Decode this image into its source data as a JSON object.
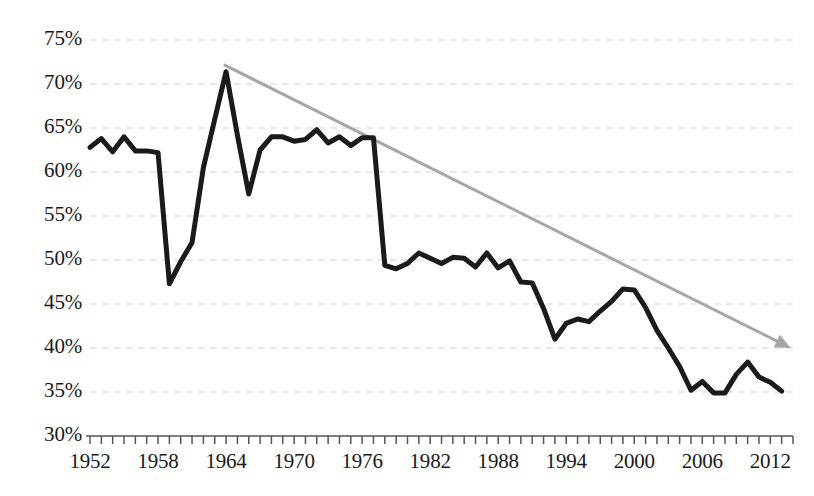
{
  "chart_data": {
    "type": "line",
    "title": "",
    "subtitle": "",
    "xlabel": "",
    "ylabel": "",
    "xlim": [
      1952,
      2014
    ],
    "ylim": [
      30,
      75
    ],
    "ytick_format": "percent",
    "grid": true,
    "grid_axis": "y",
    "grid_style": "dashed",
    "legend": "none",
    "yticks": [
      30,
      35,
      40,
      45,
      50,
      55,
      60,
      65,
      70,
      75
    ],
    "ytick_labels": [
      "30%",
      "35%",
      "40%",
      "45%",
      "50%",
      "55%",
      "60%",
      "65%",
      "70%",
      "75%"
    ],
    "xticks": [
      1952,
      1958,
      1964,
      1970,
      1976,
      1982,
      1988,
      1994,
      2000,
      2006,
      2012
    ],
    "xtick_labels": [
      "1952",
      "1958",
      "1964",
      "1970",
      "1976",
      "1982",
      "1988",
      "1994",
      "2000",
      "2006",
      "2012"
    ],
    "xtick_minor_step": 1,
    "series": [
      {
        "name": "series-1",
        "color": "#1a1a1a",
        "line_width": 5,
        "x": [
          1952,
          1953,
          1954,
          1955,
          1956,
          1957,
          1958,
          1959,
          1960,
          1961,
          1962,
          1963,
          1964,
          1965,
          1966,
          1967,
          1968,
          1969,
          1970,
          1971,
          1972,
          1973,
          1974,
          1975,
          1976,
          1977,
          1978,
          1979,
          1980,
          1981,
          1982,
          1983,
          1984,
          1985,
          1986,
          1987,
          1988,
          1989,
          1990,
          1991,
          1992,
          1993,
          1994,
          1995,
          1996,
          1997,
          1998,
          1999,
          2000,
          2001,
          2002,
          2003,
          2004,
          2005,
          2006,
          2007,
          2008,
          2009,
          2010,
          2011,
          2012,
          2013
        ],
        "y": [
          62.8,
          63.8,
          62.3,
          64.0,
          62.4,
          62.4,
          62.2,
          47.3,
          49.8,
          52.0,
          60.5,
          66.0,
          71.4,
          64.2,
          57.5,
          62.5,
          64.0,
          64.0,
          63.5,
          63.7,
          64.8,
          63.3,
          64.0,
          63.0,
          63.9,
          63.9,
          49.4,
          49.0,
          49.6,
          50.8,
          50.2,
          49.6,
          50.3,
          50.2,
          49.2,
          50.8,
          49.1,
          49.9,
          47.5,
          47.4,
          44.5,
          41.0,
          42.8,
          43.3,
          43.0,
          44.2,
          45.3,
          46.7,
          46.6,
          44.6,
          42.0,
          40.0,
          37.9,
          35.2,
          36.2,
          34.9,
          34.9,
          37.0,
          38.4,
          36.7,
          36.1,
          35.1
        ]
      }
    ],
    "annotations": [
      {
        "type": "arrow",
        "name": "trend-arrow",
        "color": "#a6a6a6",
        "line_width": 3,
        "x_start": 1963.8,
        "y_start": 72.2,
        "x_end": 2013.8,
        "y_end": 40.0
      }
    ]
  },
  "axes": {
    "axis_color": "#555555",
    "grid_color": "#e2e2e2",
    "tick_color": "#555555",
    "label_color": "#1a1a1a"
  }
}
